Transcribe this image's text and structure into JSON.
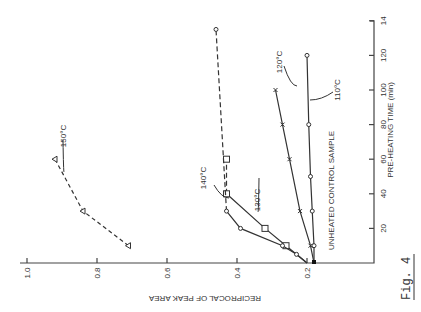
{
  "figure_label": "Fig. 4",
  "chart_data": {
    "type": "line",
    "rotation": "plotted rotated 90 degrees counter-clockwise",
    "title": "",
    "xlabel": "PRE-HEATING TIME (min)",
    "ylabel": "RECIPROCAL OF PEAK AREA",
    "xlim": [
      0,
      140
    ],
    "ylim": [
      0.2,
      1.0
    ],
    "x_ticks": [
      "20",
      "40",
      "60",
      "80",
      "100",
      "120",
      "14"
    ],
    "x_tick_values": [
      20,
      40,
      60,
      80,
      100,
      120,
      140
    ],
    "y_ticks": [
      "0.2",
      "0.4",
      "0.6",
      "0.8",
      "1.0"
    ],
    "y_tick_values": [
      0.2,
      0.4,
      0.6,
      0.8,
      1.0
    ],
    "grid": false,
    "control": {
      "label": "UNHEATED CONTROL SAMPLE",
      "x": 0,
      "y": 0.18
    },
    "series": [
      {
        "name": "110°C",
        "marker": "circle",
        "style": "solid",
        "x": [
          0,
          10,
          30,
          50,
          80,
          120
        ],
        "y": [
          0.18,
          0.18,
          0.185,
          0.19,
          0.195,
          0.2
        ]
      },
      {
        "name": "120°C",
        "marker": "x",
        "style": "solid",
        "x": [
          0,
          10,
          30,
          60,
          80,
          100
        ],
        "y": [
          0.18,
          0.19,
          0.22,
          0.25,
          0.27,
          0.29
        ]
      },
      {
        "name": "130°C",
        "marker": "square",
        "style": "solid-then-dashed",
        "x": [
          0,
          10,
          20,
          40,
          60
        ],
        "y": [
          0.2,
          0.26,
          0.32,
          0.43,
          0.43
        ]
      },
      {
        "name": "140°C",
        "marker": "circle",
        "style": "solid-then-dashed",
        "x": [
          0,
          5,
          10,
          20,
          30,
          135
        ],
        "y": [
          0.2,
          0.23,
          0.27,
          0.39,
          0.43,
          0.46
        ]
      },
      {
        "name": "150°C",
        "marker": "triangle",
        "style": "dashed",
        "x": [
          10,
          30,
          60
        ],
        "y": [
          0.71,
          0.84,
          0.92
        ]
      }
    ]
  }
}
